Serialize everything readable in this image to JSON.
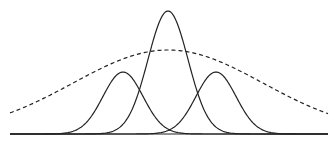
{
  "chart_data": {
    "type": "line",
    "title": "",
    "xlabel": "",
    "ylabel": "",
    "grid": false,
    "legend": null,
    "x_range_px": [
      10,
      328
    ],
    "baseline_px": 134,
    "series": [
      {
        "name": "left-narrow-gaussian",
        "style": "solid",
        "mean_px": 123,
        "peak_px": 72,
        "sigma_px": 20
      },
      {
        "name": "center-tall-gaussian",
        "style": "solid",
        "mean_px": 168,
        "peak_px": 11,
        "sigma_px": 20
      },
      {
        "name": "right-narrow-gaussian",
        "style": "solid",
        "mean_px": 216,
        "peak_px": 72,
        "sigma_px": 20
      },
      {
        "name": "wide-dashed-gaussian",
        "style": "dashed",
        "mean_px": 168,
        "peak_px": 50,
        "sigma_px": 95
      }
    ],
    "colors": {
      "line": "#222222",
      "background": "#ffffff"
    }
  }
}
